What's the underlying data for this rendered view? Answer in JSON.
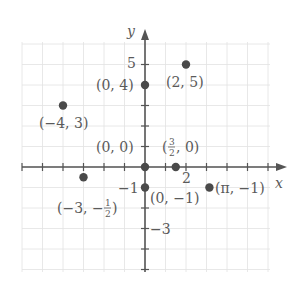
{
  "chart_data": {
    "type": "scatter",
    "title": "",
    "xlabel": "x",
    "ylabel": "y",
    "xlim": [
      -6,
      6
    ],
    "ylim": [
      -5,
      6
    ],
    "grid": true,
    "tick_labels": {
      "x": [
        {
          "value": 2,
          "label": "2"
        }
      ],
      "y": [
        {
          "value": 5,
          "label": "5"
        },
        {
          "value": -1,
          "label": "-1"
        },
        {
          "value": -3,
          "label": "-3"
        }
      ]
    },
    "points": [
      {
        "x": 2,
        "y": 5,
        "label": "(2, 5)"
      },
      {
        "x": 0,
        "y": 4,
        "label": "(0, 4)"
      },
      {
        "x": -4,
        "y": 3,
        "label": "(-4, 3)"
      },
      {
        "x": 0,
        "y": 0,
        "label": "(0, 0)"
      },
      {
        "x": 1.5,
        "y": 0,
        "label": "(3/2, 0)"
      },
      {
        "x": -3,
        "y": -0.5,
        "label": "(-3, -1/2)"
      },
      {
        "x": 0,
        "y": -1,
        "label": "(0, -1)"
      },
      {
        "x": 3.14159,
        "y": -1,
        "label": "(π, -1)"
      }
    ]
  },
  "labels": {
    "x_axis": "x",
    "y_axis": "y",
    "tick_x_2": "2",
    "tick_y_5": "5",
    "tick_y_m1": "−1",
    "tick_y_m3": "−3",
    "p_2_5": "(2, 5)",
    "p_0_4": "(0, 4)",
    "p_m4_3": "(−4, 3)",
    "p_0_0": "(0, 0)",
    "p_32_0_open": "(",
    "p_32_0_num": "3",
    "p_32_0_den": "2",
    "p_32_0_rest": ", 0)",
    "p_m3_mh_open": "(−3, −",
    "p_m3_mh_num": "1",
    "p_m3_mh_den": "2",
    "p_m3_mh_close": ")",
    "p_0_m1": "(0, −1)",
    "p_pi_m1": "(π, −1)"
  },
  "colors": {
    "grid": "#e2e2e2",
    "axis": "#555555",
    "point": "#4a4a4a",
    "text": "#5a5a5a"
  }
}
